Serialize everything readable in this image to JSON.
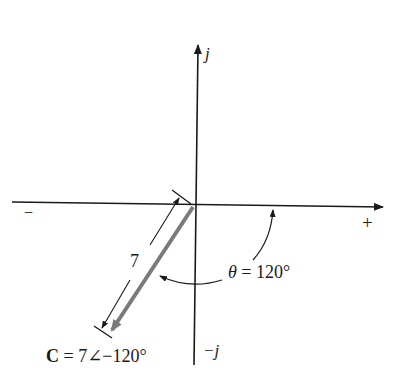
{
  "diagram": {
    "type": "phasor-diagram",
    "axes": {
      "positive_imag_label": "j",
      "negative_imag_label": "−j",
      "negative_real_label": "−",
      "positive_real_label": "+"
    },
    "phasor": {
      "name": "C",
      "magnitude": 7,
      "angle_deg": -120,
      "magnitude_label": "7",
      "expression_name": "C",
      "expression_rest": "= 7∠−120°",
      "color": "#7a7a7a"
    },
    "angle_annotation": {
      "symbol": "θ",
      "text": "= 120°",
      "value_deg": 120
    },
    "colors": {
      "axis": "#1a1a1a",
      "background": "#ffffff"
    }
  }
}
